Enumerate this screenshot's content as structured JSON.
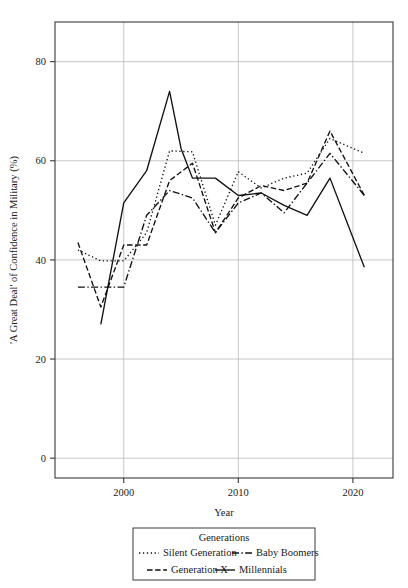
{
  "chart_data": {
    "type": "line",
    "title": "",
    "xlabel": "Year",
    "ylabel": "'A Great Deal' of Confidence in Military (%)",
    "xlim": [
      1994,
      2023.5
    ],
    "ylim": [
      -4,
      88
    ],
    "xticks": [
      2000,
      2010,
      2020
    ],
    "xtick_labels": [
      "2000",
      "2010",
      "2020"
    ],
    "yticks": [
      0,
      20,
      40,
      60,
      80
    ],
    "ytick_labels": [
      "0",
      "20",
      "40",
      "60",
      "80"
    ],
    "grid": true,
    "legend": {
      "position": "below",
      "title": "Generations",
      "entries": [
        {
          "label": "Silent Generation",
          "dash": "dotted"
        },
        {
          "label": "Baby Boomers",
          "dash": "dashdot"
        },
        {
          "label": "Generation X",
          "dash": "dashed"
        },
        {
          "label": "Millennials",
          "dash": "solid"
        }
      ]
    },
    "series": [
      {
        "name": "Silent Generation",
        "dash": "dotted",
        "x": [
          1996,
          1998,
          2000,
          2002,
          2004,
          2006,
          2008,
          2010,
          2012,
          2014,
          2016,
          2018,
          2021
        ],
        "y": [
          42.0,
          39.8,
          39.8,
          45.5,
          62.0,
          61.8,
          47.0,
          57.8,
          54.5,
          56.5,
          57.5,
          64.5,
          61.5
        ]
      },
      {
        "name": "Baby Boomers",
        "dash": "dashdot",
        "x": [
          1996,
          1998,
          2000,
          2002,
          2004,
          2006,
          2008,
          2010,
          2012,
          2014,
          2016,
          2018,
          2021
        ],
        "y": [
          34.5,
          34.5,
          34.5,
          49.0,
          54.0,
          52.5,
          45.5,
          51.5,
          53.5,
          49.5,
          55.5,
          61.5,
          53.0
        ]
      },
      {
        "name": "Generation X",
        "dash": "dashed",
        "x": [
          1996,
          1998,
          2000,
          2002,
          2004,
          2006,
          2008,
          2010,
          2012,
          2014,
          2016,
          2018,
          2021
        ],
        "y": [
          43.5,
          30.5,
          43.0,
          43.0,
          56.0,
          59.5,
          45.5,
          52.5,
          55.0,
          54.0,
          55.5,
          66.0,
          53.0
        ]
      },
      {
        "name": "Millennials",
        "dash": "solid",
        "x": [
          1998,
          2000,
          2002,
          2004,
          2005,
          2006,
          2008,
          2010,
          2012,
          2014,
          2016,
          2018,
          2021
        ],
        "y": [
          27.0,
          51.5,
          58.0,
          74.0,
          62.5,
          56.5,
          56.5,
          53.0,
          53.5,
          51.0,
          49.0,
          56.5,
          38.5
        ]
      }
    ]
  },
  "colors": {
    "line": "#111111",
    "axis": "#3a3a3a",
    "grid": "#b9b9b9",
    "background": "#ffffff"
  }
}
